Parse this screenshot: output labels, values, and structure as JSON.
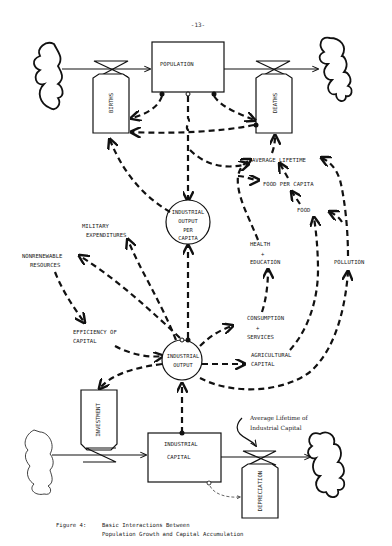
{
  "page": {
    "number": "-13-"
  },
  "stocks": {
    "population": "POPULATION",
    "industrial_capital_1": "INDUSTRIAL",
    "industrial_capital_2": "CAPITAL"
  },
  "flows": {
    "births": "BIRTHS",
    "deaths": "DEATHS",
    "investment": "INVESTMENT",
    "depreciation": "DEPRECIATION"
  },
  "auxiliaries": {
    "iopc_1": "INDUSTRIAL",
    "iopc_2": "OUTPUT",
    "iopc_3": "PER",
    "iopc_4": "CAPITA",
    "io_1": "INDUSTRIAL",
    "io_2": "OUTPUT"
  },
  "variables": {
    "average_lifetime": "AVERAGE LIFETIME",
    "food_per_capita": "FOOD PER CAPITA",
    "food": "FOOD",
    "military_1": "MILITARY",
    "military_2": "EXPENDITURES",
    "nonrenewable_1": "NONRENEWABLE",
    "nonrenewable_2": "RESOURCES",
    "health_1": "HEALTH",
    "health_2": "+",
    "health_3": "EDUCATION",
    "pollution": "POLLUTION",
    "efficiency_1": "EFFICIENCY OF",
    "efficiency_2": "CAPITAL",
    "consumption_1": "CONSUMPTION",
    "consumption_2": "+",
    "consumption_3": "SERVICES",
    "agricultural_1": "AGRICULTURAL",
    "agricultural_2": "CAPITAL",
    "avg_life_ic_1": "Average Lifetime of",
    "avg_life_ic_2": "Industrial Capital"
  },
  "caption": {
    "label": "Figure 4:",
    "line1": "Basic Interactions Between",
    "line2": "Population Growth and Capital Accumulation"
  }
}
